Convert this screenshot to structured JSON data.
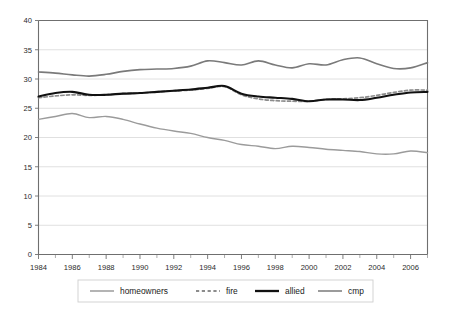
{
  "chart_data": {
    "type": "line",
    "title": "",
    "subtitle": "",
    "xlabel": "",
    "ylabel": "",
    "xlim": [
      1984,
      2007
    ],
    "ylim": [
      0,
      40
    ],
    "yticks": [
      0,
      5,
      10,
      15,
      20,
      25,
      30,
      35,
      40
    ],
    "ytick_labels": [
      "0",
      "5",
      "10",
      "15",
      "20",
      "25",
      "30",
      "35",
      "40"
    ],
    "xticks": [
      1984,
      1986,
      1988,
      1990,
      1992,
      1994,
      1996,
      1998,
      2000,
      2002,
      2004,
      2006
    ],
    "xtick_labels": [
      "1984",
      "1986",
      "1988",
      "1990",
      "1992",
      "1994",
      "1996",
      "1998",
      "2000",
      "2002",
      "2004",
      "2006"
    ],
    "x_minor_ticks": [
      1985,
      1987,
      1989,
      1991,
      1993,
      1995,
      1997,
      1999,
      2001,
      2003,
      2005,
      2007
    ],
    "grid": "horizontal",
    "legend_position": "bottom",
    "x": [
      1984,
      1985,
      1986,
      1987,
      1988,
      1989,
      1990,
      1991,
      1992,
      1993,
      1994,
      1995,
      1996,
      1997,
      1998,
      1999,
      2000,
      2001,
      2002,
      2003,
      2004,
      2005,
      2006,
      2007
    ],
    "series": [
      {
        "name": "homeowners",
        "color": "#9b9b9b",
        "style": "solid",
        "width": 1.4,
        "values": [
          23.1,
          23.6,
          24.1,
          23.4,
          23.6,
          23.1,
          22.3,
          21.6,
          21.1,
          20.7,
          20.0,
          19.5,
          18.8,
          18.5,
          18.1,
          18.5,
          18.3,
          18.0,
          17.8,
          17.6,
          17.2,
          17.2,
          17.7,
          17.4
        ]
      },
      {
        "name": "fire",
        "color": "#8c8c8c",
        "style": "dashed",
        "width": 1.7,
        "values": [
          26.8,
          27.1,
          27.3,
          27.2,
          27.3,
          27.5,
          27.6,
          27.8,
          28.0,
          28.1,
          28.4,
          28.7,
          27.3,
          26.6,
          26.3,
          26.2,
          26.2,
          26.5,
          26.6,
          26.8,
          27.2,
          27.7,
          28.1,
          28.1
        ]
      },
      {
        "name": "allied",
        "color": "#111111",
        "style": "solid",
        "width": 2.1,
        "values": [
          27.0,
          27.6,
          27.8,
          27.3,
          27.3,
          27.5,
          27.6,
          27.8,
          28.0,
          28.2,
          28.5,
          28.8,
          27.5,
          27.0,
          26.8,
          26.6,
          26.2,
          26.5,
          26.5,
          26.4,
          26.8,
          27.3,
          27.7,
          27.8
        ]
      },
      {
        "name": "cmp",
        "color": "#7a7a7a",
        "style": "solid",
        "width": 1.6,
        "values": [
          31.2,
          31.0,
          30.7,
          30.5,
          30.8,
          31.3,
          31.6,
          31.7,
          31.8,
          32.2,
          33.1,
          32.8,
          32.4,
          33.1,
          32.4,
          31.9,
          32.6,
          32.4,
          33.3,
          33.6,
          32.6,
          31.8,
          31.9,
          32.8
        ]
      }
    ],
    "legend": [
      {
        "label": "homeowners",
        "color": "#9b9b9b",
        "style": "solid"
      },
      {
        "label": "fire",
        "color": "#8c8c8c",
        "style": "dashed"
      },
      {
        "label": "allied",
        "color": "#111111",
        "style": "solid"
      },
      {
        "label": "cmp",
        "color": "#7a7a7a",
        "style": "solid"
      }
    ]
  },
  "colors": {
    "background": "#ffffff",
    "grid": "#d8d8d8",
    "axis": "#6f6f6f",
    "text": "#2b2b2b",
    "legend_border": "#cfcfcf"
  }
}
